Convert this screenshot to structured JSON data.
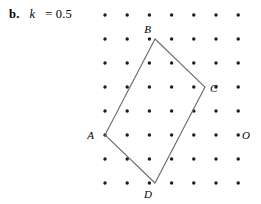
{
  "caption": {
    "enumerator": "b.",
    "variable": "k",
    "equals_value": "= 0.5"
  },
  "figure": {
    "grid": {
      "columns": 7,
      "rows": 8,
      "origin_x": 105,
      "origin_y": 15,
      "spacing_x": 22.2,
      "spacing_y": 24,
      "dot_radius": 1.7,
      "dot_color": "#1a1a1a"
    },
    "stroke_color": "#6b6b6b",
    "vertices": [
      {
        "label": "A",
        "x": 105,
        "y": 135,
        "label_dx": -11,
        "label_dy": 4
      },
      {
        "label": "B",
        "x": 155,
        "y": 39,
        "label_dx": -4,
        "label_dy": -6
      },
      {
        "label": "C",
        "x": 205,
        "y": 87,
        "label_dx": 5,
        "label_dy": 5
      },
      {
        "label": "D",
        "x": 155,
        "y": 183,
        "label_dx": -3,
        "label_dy": 15
      }
    ],
    "polygon_order": "A,B,C,D",
    "extra_points": [
      {
        "label": "O",
        "x": 238,
        "y": 135,
        "label_dx": 4,
        "label_dy": 4
      }
    ]
  }
}
